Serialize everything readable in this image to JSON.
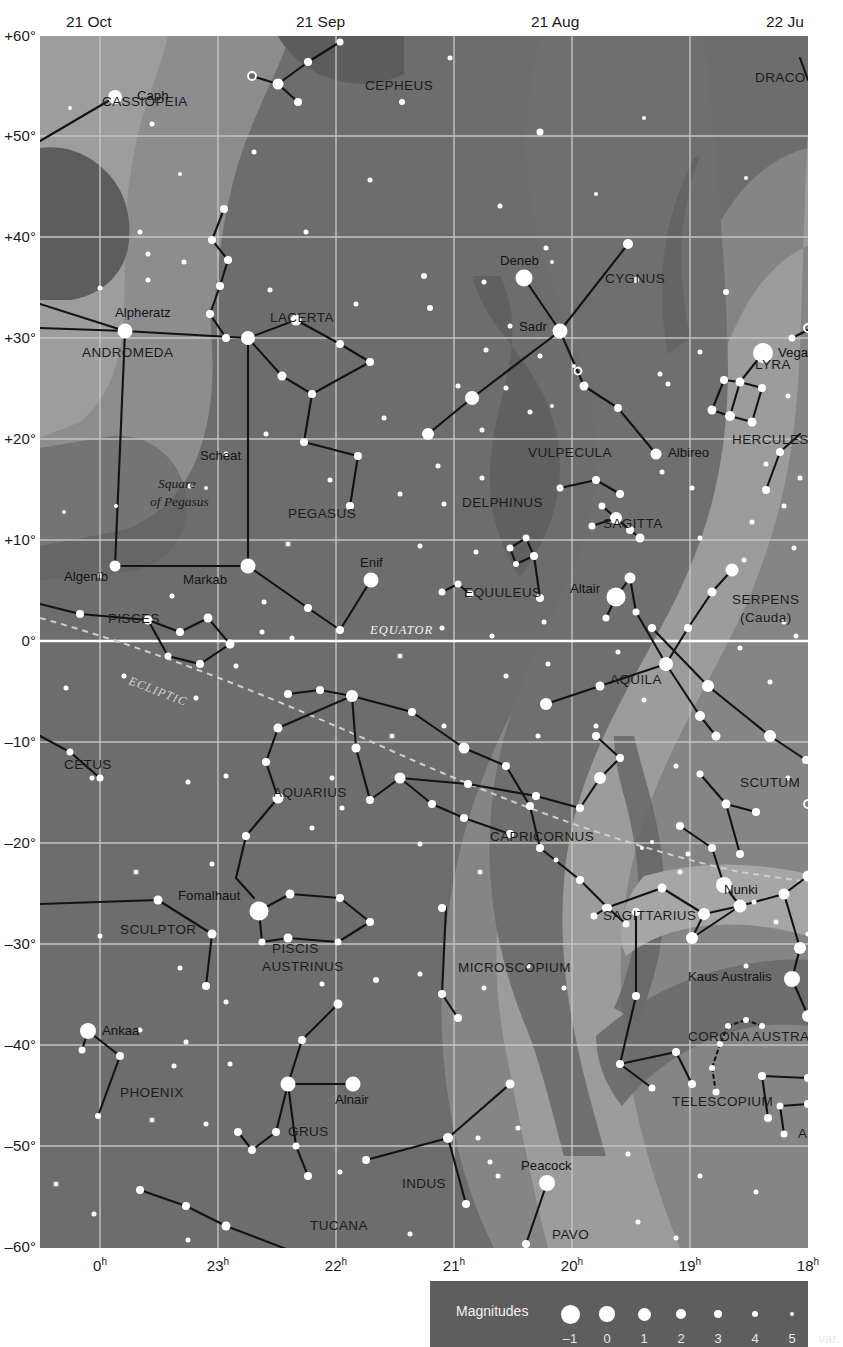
{
  "chart_data": {
    "type": "scatter",
    "xlabel": "Right Ascension",
    "ylabel": "Declination",
    "x_ticks": [
      "0h",
      "23h",
      "22h",
      "21h",
      "20h",
      "19h",
      "18h"
    ],
    "y_ticks": [
      "+60°",
      "+50°",
      "+40°",
      "+30°",
      "+20°",
      "+10°",
      "0°",
      "–10°",
      "–20°",
      "–30°",
      "–40°",
      "–50°",
      "–60°"
    ],
    "xlim": [
      "0h",
      "18h"
    ],
    "ylim": [
      -60,
      60
    ],
    "grid": true,
    "date_ticks": [
      "21 Oct",
      "21 Sep",
      "21 Aug",
      "22 Ju"
    ],
    "reference_lines": [
      {
        "name": "EQUATOR",
        "style": "solid-white",
        "dec": 0
      },
      {
        "name": "ECLIPTIC",
        "style": "dashed-gray"
      }
    ],
    "legend": {
      "title": "Magnitudes",
      "entries": [
        "–1",
        "0",
        "1",
        "2",
        "3",
        "4",
        "5",
        "var."
      ]
    }
  },
  "axes": {
    "declination": [
      {
        "label": "+60°",
        "y": 0
      },
      {
        "label": "+50°",
        "y": 100
      },
      {
        "label": "+40°",
        "y": 201
      },
      {
        "label": "+30°",
        "y": 302
      },
      {
        "label": "+20°",
        "y": 403
      },
      {
        "label": "+10°",
        "y": 504
      },
      {
        "label": "0°",
        "y": 605
      },
      {
        "label": "–10°",
        "y": 706
      },
      {
        "label": "–20°",
        "y": 807
      },
      {
        "label": "–30°",
        "y": 908
      },
      {
        "label": "–40°",
        "y": 1009
      },
      {
        "label": "–50°",
        "y": 1110
      },
      {
        "label": "–60°",
        "y": 1211
      }
    ],
    "rightascension": [
      {
        "label": "0",
        "unit": "h",
        "x": 60
      },
      {
        "label": "23",
        "unit": "h",
        "x": 178
      },
      {
        "label": "22",
        "unit": "h",
        "x": 296
      },
      {
        "label": "21",
        "unit": "h",
        "x": 414
      },
      {
        "label": "20",
        "unit": "h",
        "x": 532
      },
      {
        "label": "19",
        "unit": "h",
        "x": 650
      },
      {
        "label": "18",
        "unit": "h",
        "x": 768
      }
    ],
    "dates": [
      {
        "label": "21 Oct",
        "x": 60
      },
      {
        "label": "21 Sep",
        "x": 290
      },
      {
        "label": "21 Aug",
        "x": 525
      },
      {
        "label": "22 Ju",
        "x": 760
      }
    ]
  },
  "constellations": [
    {
      "name": "CASSIOPEIA",
      "x": 62,
      "y": 70
    },
    {
      "name": "CEPHEUS",
      "x": 325,
      "y": 54
    },
    {
      "name": "DRACO",
      "x": 715,
      "y": 46
    },
    {
      "name": "LACERTA",
      "x": 230,
      "y": 286
    },
    {
      "name": "CYGNUS",
      "x": 565,
      "y": 247
    },
    {
      "name": "ANDROMEDA",
      "x": 42,
      "y": 321
    },
    {
      "name": "LYRA",
      "x": 715,
      "y": 333
    },
    {
      "name": "HERCULES",
      "x": 692,
      "y": 408
    },
    {
      "name": "VULPECULA",
      "x": 488,
      "y": 421
    },
    {
      "name": "PEGASUS",
      "x": 248,
      "y": 482
    },
    {
      "name": "DELPHINUS",
      "x": 422,
      "y": 471
    },
    {
      "name": "SAGITTA",
      "x": 563,
      "y": 492
    },
    {
      "name": "EQUULEUS",
      "x": 424,
      "y": 561
    },
    {
      "name": "SERPENS",
      "x": 692,
      "y": 568
    },
    {
      "name": "(Cauda)",
      "x": 700,
      "y": 586
    },
    {
      "name": "PISCES",
      "x": 68,
      "y": 587
    },
    {
      "name": "AQUILA",
      "x": 570,
      "y": 648
    },
    {
      "name": "CETUS",
      "x": 24,
      "y": 733
    },
    {
      "name": "AQUARIUS",
      "x": 233,
      "y": 761
    },
    {
      "name": "SCUTUM",
      "x": 700,
      "y": 751
    },
    {
      "name": "CAPRICORNUS",
      "x": 450,
      "y": 805
    },
    {
      "name": "SAGITTARIUS",
      "x": 563,
      "y": 884
    },
    {
      "name": "SCULPTOR",
      "x": 80,
      "y": 898
    },
    {
      "name": "PISCIS",
      "x": 232,
      "y": 917
    },
    {
      "name": "AUSTRINUS",
      "x": 222,
      "y": 935
    },
    {
      "name": "MICROSCOPIUM",
      "x": 418,
      "y": 936
    },
    {
      "name": "CORONA AUSTRALIS",
      "x": 648,
      "y": 1005
    },
    {
      "name": "PHOENIX",
      "x": 80,
      "y": 1061
    },
    {
      "name": "TELESCOPIUM",
      "x": 632,
      "y": 1070
    },
    {
      "name": "GRUS",
      "x": 248,
      "y": 1100
    },
    {
      "name": "ARA",
      "x": 758,
      "y": 1102
    },
    {
      "name": "INDUS",
      "x": 362,
      "y": 1152
    },
    {
      "name": "TUCANA",
      "x": 270,
      "y": 1194
    },
    {
      "name": "PAVO",
      "x": 512,
      "y": 1203
    }
  ],
  "named_stars": [
    {
      "name": "Caph",
      "x": 75,
      "y": 61,
      "mag": 2.2,
      "lx": 97,
      "ly": 64
    },
    {
      "name": "Deneb",
      "x": 484,
      "y": 242,
      "mag": 1.2,
      "lx": 460,
      "ly": 229
    },
    {
      "name": "Sadr",
      "x": 520,
      "y": 295,
      "mag": 2.2,
      "lx": 479,
      "ly": 295
    },
    {
      "name": "Vega",
      "x": 723,
      "y": 317,
      "mag": 0.0,
      "lx": 738,
      "ly": 321
    },
    {
      "name": "Alpheratz",
      "x": 85,
      "y": 295,
      "mag": 2.0,
      "lx": 75,
      "ly": 281
    },
    {
      "name": "Scheat",
      "x": 208,
      "y": 302,
      "mag": 2.4,
      "lx": 160,
      "ly": 424
    },
    {
      "name": "Albireo",
      "x": 616,
      "y": 418,
      "mag": 3.0,
      "lx": 628,
      "ly": 421
    },
    {
      "name": "Algenib",
      "x": 75,
      "y": 530,
      "mag": 2.8,
      "lx": 24,
      "ly": 545
    },
    {
      "name": "Markab",
      "x": 208,
      "y": 530,
      "mag": 2.4,
      "lx": 143,
      "ly": 548
    },
    {
      "name": "Enif",
      "x": 331,
      "y": 544,
      "mag": 2.4,
      "lx": 320,
      "ly": 531
    },
    {
      "name": "Altair",
      "x": 576,
      "y": 561,
      "mag": 0.8,
      "lx": 530,
      "ly": 557
    },
    {
      "name": "Nunki",
      "x": 684,
      "y": 849,
      "mag": 2.0,
      "lx": 684,
      "ly": 858
    },
    {
      "name": "Fomalhaut",
      "x": 219,
      "y": 875,
      "mag": 1.2,
      "lx": 138,
      "ly": 864
    },
    {
      "name": "Kaus Australis",
      "x": 752,
      "y": 943,
      "mag": 1.8,
      "lx": 648,
      "ly": 945
    },
    {
      "name": "Ankaa",
      "x": 48,
      "y": 995,
      "mag": 2.4,
      "lx": 62,
      "ly": 999
    },
    {
      "name": "Alnair",
      "x": 313,
      "y": 1048,
      "mag": 1.7,
      "lx": 295,
      "ly": 1068
    },
    {
      "name": "Peacock",
      "x": 507,
      "y": 1147,
      "mag": 1.9,
      "lx": 481,
      "ly": 1134
    }
  ],
  "lines": {
    "equator_label": "EQUATOR",
    "ecliptic_label": "ECLIPTIC",
    "square_label_1": "Square",
    "square_label_2": "of Pegasus"
  },
  "legend": {
    "title": "Magnitudes",
    "items": [
      {
        "label": "–1",
        "size": 19
      },
      {
        "label": "0",
        "size": 15.5
      },
      {
        "label": "1",
        "size": 13
      },
      {
        "label": "2",
        "size": 10.5
      },
      {
        "label": "3",
        "size": 8
      },
      {
        "label": "4",
        "size": 6
      },
      {
        "label": "5",
        "size": 4.5
      },
      {
        "label": "var.",
        "size": 7.5
      }
    ]
  },
  "colors": {
    "sky": "#6d6d6d",
    "milkyway_mid": "#878787",
    "milkyway_bright": "#9b9b9b",
    "milkyway_dark": "#5a5a5a",
    "grid": "#c9c9c9",
    "star": "#ffffff",
    "constline": "#131313",
    "legend_bg": "#5e5e5e",
    "page": "#ffffff"
  }
}
